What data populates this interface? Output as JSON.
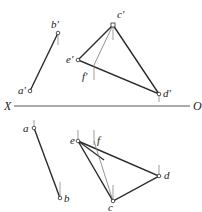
{
  "header_fragment": "",
  "axis": {
    "left_label": "X",
    "right_label": "O"
  },
  "labels": {
    "a_prime": "a'",
    "b_prime": "b'",
    "c_prime": "c'",
    "d_prime": "d'",
    "e_prime": "e'",
    "f_prime": "f'",
    "a": "a",
    "b": "b",
    "c": "c",
    "d": "d",
    "e": "e",
    "f": "f"
  },
  "colors": {
    "line": "#2a2a2a",
    "thin": "#777777",
    "text": "#222222"
  }
}
